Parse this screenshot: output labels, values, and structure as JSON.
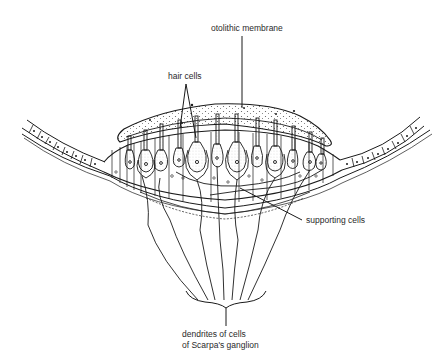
{
  "figure": {
    "labels": {
      "otolithic_membrane": "otolithic membrane",
      "hair_cells": "hair cells",
      "supporting_cells": "supporting cells",
      "dendrites_line1": "dendrites of cells",
      "dendrites_line2": "of Scarpa's ganglion"
    },
    "colors": {
      "ink": "#1a1a1a",
      "text": "#2a2a2a",
      "background": "#ffffff",
      "stipple": "#555555"
    }
  }
}
